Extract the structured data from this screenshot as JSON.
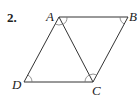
{
  "problem": {
    "number": "2."
  },
  "diagram": {
    "type": "parallelogram-with-diagonal",
    "vertices": [
      {
        "label": "A",
        "x": 59,
        "y": 17
      },
      {
        "label": "B",
        "x": 128,
        "y": 17
      },
      {
        "label": "C",
        "x": 93,
        "y": 82
      },
      {
        "label": "D",
        "x": 24,
        "y": 82
      }
    ],
    "segments": [
      "AB",
      "BC",
      "CD",
      "DA",
      "AC"
    ],
    "angle_marks": [
      "A (angle DAC)",
      "A (angle CAB)",
      "B",
      "C (angle ACD)",
      "C (angle ACB)",
      "D"
    ],
    "stroke_color": "#333333"
  }
}
